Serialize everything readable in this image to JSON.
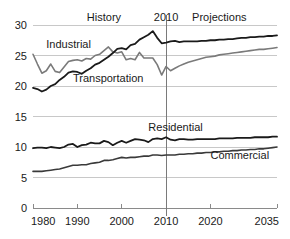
{
  "chart_data": {
    "type": "line",
    "title": "",
    "subtitle": "",
    "xlabel": "",
    "ylabel": "",
    "xlim": [
      1980,
      2035
    ],
    "ylim": [
      0,
      30
    ],
    "grid": true,
    "legend_position": "inline-annotations",
    "x_ticks": [
      "1980",
      "1990",
      "2000",
      "2010",
      "2020",
      "2035"
    ],
    "x_tick_values": [
      1980,
      1990,
      2000,
      2010,
      2020,
      2035
    ],
    "y_ticks": [
      "0",
      "5",
      "10",
      "15",
      "20",
      "25",
      "30"
    ],
    "y_tick_values": [
      0,
      5,
      10,
      15,
      20,
      25,
      30
    ],
    "annotations": [
      {
        "text": "History",
        "x": 1996,
        "y": 30.6,
        "name": "history-label"
      },
      {
        "text": "2010",
        "x": 2010,
        "y": 30.6,
        "name": "divider-year-label"
      },
      {
        "text": "Projections",
        "x": 2022,
        "y": 30.6,
        "name": "projections-label"
      }
    ],
    "divider": {
      "x": 2010,
      "label": "2010"
    },
    "series": [
      {
        "name": "Industrial",
        "color": "#7a7a7a",
        "width": 1.6,
        "label_x": 1983,
        "label_y": 26.3,
        "x": [
          1980,
          1981,
          1982,
          1983,
          1984,
          1985,
          1986,
          1987,
          1988,
          1989,
          1990,
          1991,
          1992,
          1993,
          1994,
          1995,
          1996,
          1997,
          1998,
          1999,
          2000,
          2001,
          2002,
          2003,
          2004,
          2005,
          2006,
          2007,
          2008,
          2009,
          2010,
          2011,
          2012,
          2013,
          2014,
          2015,
          2016,
          2017,
          2018,
          2019,
          2020,
          2021,
          2022,
          2023,
          2024,
          2025,
          2026,
          2027,
          2028,
          2029,
          2030,
          2031,
          2032,
          2033,
          2034,
          2035
        ],
        "values": [
          25.2,
          23.6,
          22.1,
          22.5,
          23.6,
          22.4,
          22.2,
          23.1,
          24.0,
          24.2,
          24.3,
          24.1,
          24.5,
          24.4,
          25.0,
          25.2,
          25.8,
          26.4,
          25.6,
          25.4,
          25.6,
          24.3,
          24.5,
          24.3,
          25.5,
          24.6,
          24.6,
          24.6,
          23.5,
          21.8,
          23.2,
          22.5,
          22.9,
          23.3,
          23.6,
          23.9,
          24.1,
          24.3,
          24.5,
          24.7,
          24.8,
          24.9,
          25.1,
          25.2,
          25.3,
          25.4,
          25.5,
          25.6,
          25.7,
          25.8,
          25.9,
          26.0,
          26.0,
          26.1,
          26.2,
          26.3
        ]
      },
      {
        "name": "Transportation",
        "color": "#1a1a1a",
        "width": 1.8,
        "label_x": 1989,
        "label_y": 20.6,
        "x": [
          1980,
          1981,
          1982,
          1983,
          1984,
          1985,
          1986,
          1987,
          1988,
          1989,
          1990,
          1991,
          1992,
          1993,
          1994,
          1995,
          1996,
          1997,
          1998,
          1999,
          2000,
          2001,
          2002,
          2003,
          2004,
          2005,
          2006,
          2007,
          2008,
          2009,
          2010,
          2011,
          2012,
          2013,
          2014,
          2015,
          2016,
          2017,
          2018,
          2019,
          2020,
          2021,
          2022,
          2023,
          2024,
          2025,
          2026,
          2027,
          2028,
          2029,
          2030,
          2031,
          2032,
          2033,
          2034,
          2035
        ],
        "values": [
          19.7,
          19.5,
          19.1,
          19.4,
          20.0,
          20.3,
          21.0,
          21.5,
          22.2,
          22.4,
          22.3,
          22.0,
          22.5,
          22.9,
          23.5,
          23.8,
          24.3,
          24.8,
          25.4,
          26.1,
          26.2,
          26.0,
          26.7,
          26.9,
          27.6,
          28.0,
          28.4,
          29.0,
          27.9,
          27.0,
          27.1,
          27.3,
          27.4,
          27.2,
          27.3,
          27.3,
          27.3,
          27.3,
          27.4,
          27.4,
          27.5,
          27.5,
          27.6,
          27.6,
          27.7,
          27.7,
          27.8,
          27.9,
          27.9,
          28.0,
          28.0,
          28.1,
          28.1,
          28.2,
          28.2,
          28.3
        ]
      },
      {
        "name": "Residential",
        "color": "#1a1a1a",
        "width": 1.8,
        "label_x": 2006,
        "label_y": 12.7,
        "x": [
          1980,
          1981,
          1982,
          1983,
          1984,
          1985,
          1986,
          1987,
          1988,
          1989,
          1990,
          1991,
          1992,
          1993,
          1994,
          1995,
          1996,
          1997,
          1998,
          1999,
          2000,
          2001,
          2002,
          2003,
          2004,
          2005,
          2006,
          2007,
          2008,
          2009,
          2010,
          2011,
          2012,
          2013,
          2014,
          2015,
          2016,
          2017,
          2018,
          2019,
          2020,
          2021,
          2022,
          2023,
          2024,
          2025,
          2026,
          2027,
          2028,
          2029,
          2030,
          2031,
          2032,
          2033,
          2034,
          2035
        ],
        "values": [
          9.8,
          9.9,
          9.9,
          9.8,
          10.0,
          9.9,
          9.8,
          10.0,
          10.4,
          10.5,
          10.0,
          10.3,
          10.4,
          10.7,
          10.6,
          10.6,
          11.0,
          10.8,
          10.3,
          10.7,
          11.0,
          10.7,
          11.0,
          11.3,
          11.2,
          11.1,
          10.8,
          11.3,
          11.4,
          11.3,
          11.6,
          11.2,
          11.1,
          11.3,
          11.3,
          11.2,
          11.2,
          11.3,
          11.3,
          11.3,
          11.3,
          11.3,
          11.4,
          11.4,
          11.4,
          11.4,
          11.5,
          11.5,
          11.5,
          11.5,
          11.6,
          11.6,
          11.6,
          11.6,
          11.7,
          11.7
        ]
      },
      {
        "name": "Commercial",
        "color": "#3a3a3a",
        "width": 1.6,
        "label_x": 2020,
        "label_y": 8.0,
        "x": [
          1980,
          1981,
          1982,
          1983,
          1984,
          1985,
          1986,
          1987,
          1988,
          1989,
          1990,
          1991,
          1992,
          1993,
          1994,
          1995,
          1996,
          1997,
          1998,
          1999,
          2000,
          2001,
          2002,
          2003,
          2004,
          2005,
          2006,
          2007,
          2008,
          2009,
          2010,
          2011,
          2012,
          2013,
          2014,
          2015,
          2016,
          2017,
          2018,
          2019,
          2020,
          2021,
          2022,
          2023,
          2024,
          2025,
          2026,
          2027,
          2028,
          2029,
          2030,
          2031,
          2032,
          2033,
          2034,
          2035
        ],
        "values": [
          6.0,
          6.0,
          6.0,
          6.1,
          6.2,
          6.3,
          6.4,
          6.6,
          6.8,
          7.0,
          7.0,
          7.1,
          7.1,
          7.3,
          7.4,
          7.5,
          7.8,
          7.8,
          7.9,
          8.1,
          8.3,
          8.2,
          8.3,
          8.3,
          8.4,
          8.5,
          8.5,
          8.7,
          8.7,
          8.6,
          8.7,
          8.7,
          8.7,
          8.8,
          8.8,
          8.9,
          8.9,
          9.0,
          9.0,
          9.1,
          9.1,
          9.2,
          9.2,
          9.3,
          9.3,
          9.4,
          9.4,
          9.5,
          9.5,
          9.6,
          9.6,
          9.7,
          9.7,
          9.8,
          9.9,
          10.0
        ]
      }
    ]
  }
}
